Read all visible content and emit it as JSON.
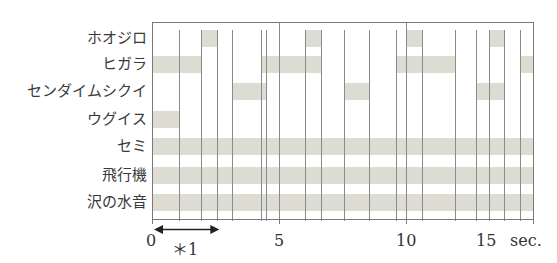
{
  "chart_data": {
    "type": "timeline",
    "title": "",
    "xlabel": "sec.",
    "ylabel": "",
    "xlim": [
      0,
      15
    ],
    "x_ticks": [
      0,
      5,
      10,
      15
    ],
    "x_tick_labels": [
      "0",
      "5",
      "10",
      "15"
    ],
    "x_unit_label": "sec.",
    "grid": "vertical lines at bar boundaries",
    "rows": [
      {
        "name": "ホオジロ",
        "intervals": [
          [
            1.93,
            2.56
          ],
          [
            6.02,
            6.65
          ],
          [
            10.0,
            10.63
          ],
          [
            13.27,
            13.86
          ]
        ]
      },
      {
        "name": "ヒガラ",
        "intervals": [
          [
            0.0,
            1.93
          ],
          [
            4.29,
            6.65
          ],
          [
            9.6,
            11.93
          ],
          [
            14.49,
            15.0
          ]
        ]
      },
      {
        "name": "センダイムシクイ",
        "intervals": [
          [
            3.15,
            4.49
          ],
          [
            7.56,
            8.54
          ],
          [
            12.76,
            13.86
          ]
        ]
      },
      {
        "name": "ウグイス",
        "intervals": [
          [
            0.0,
            1.06
          ]
        ]
      },
      {
        "name": "セミ",
        "intervals": [
          [
            0.0,
            15.0
          ]
        ]
      },
      {
        "name": "飛行機",
        "intervals": [
          [
            0.0,
            15.0
          ]
        ]
      },
      {
        "name": "沢の水音",
        "intervals": [
          [
            0.0,
            15.0
          ]
        ]
      }
    ],
    "vertical_lines": [
      1.06,
      1.93,
      2.56,
      3.15,
      4.29,
      4.49,
      5.0,
      6.02,
      6.65,
      7.56,
      8.54,
      9.6,
      10.0,
      10.63,
      11.93,
      12.76,
      13.27,
      13.86,
      14.49
    ],
    "annotation": {
      "label": "＊1",
      "arrow_from": 0,
      "arrow_to": 2.65
    }
  },
  "colors": {
    "bar_fill": "#dcdcd3",
    "grid_line": "#8a8a8a",
    "axis": "#7a7a7a",
    "text": "#333333"
  }
}
